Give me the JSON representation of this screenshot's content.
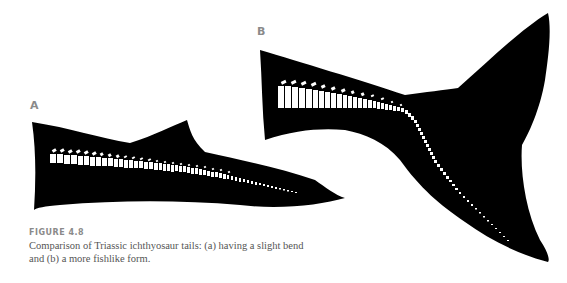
{
  "figure": {
    "panel_a_label": "A",
    "panel_b_label": "B",
    "number": "FIGURE 4.8",
    "caption": "Comparison of Triassic ichthyosaur tails: (a) having a slight bend and (b) a more fishlike form."
  }
}
